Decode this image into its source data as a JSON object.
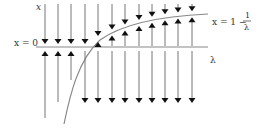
{
  "diagram": {
    "type": "bifurcation-flow-diagram",
    "labels": {
      "x_axis_label": "x",
      "origin_line_label": "x = 0",
      "curve_label_prefix": "x = 1 −",
      "curve_label_numerator": "1",
      "curve_label_denominator": "λ",
      "lambda_axis_label": "λ"
    },
    "colors": {
      "line": "#777777",
      "arrowhead": "#111111",
      "axis": "#888888",
      "curve": "#888888",
      "text": "#333333"
    },
    "axis": {
      "y": 47,
      "x_start": 36,
      "x_end": 208
    },
    "columns": [
      {
        "x": 45,
        "top": "down",
        "region": "above-both",
        "bottom_dir": "up",
        "bottom_end": 118
      },
      {
        "x": 58,
        "top": "down",
        "region": "above-both",
        "bottom_dir": "up",
        "bottom_end": 102
      },
      {
        "x": 71,
        "top": "down",
        "region": "above-both",
        "bottom_dir": "up",
        "bottom_end": 80
      },
      {
        "x": 85,
        "top": "down",
        "region": "above-both",
        "bottom_dir": "down",
        "bottom_end": 103
      },
      {
        "x": 98,
        "top": "down",
        "region": "between",
        "bottom_dir": "down",
        "bottom_end": 103
      },
      {
        "x": 112,
        "top": "down",
        "region": "between",
        "bottom_dir": "down",
        "bottom_end": 103
      },
      {
        "x": 125,
        "top": "down",
        "region": "between",
        "bottom_dir": "down",
        "bottom_end": 103
      },
      {
        "x": 139,
        "top": "down",
        "region": "between",
        "bottom_dir": "down",
        "bottom_end": 103
      },
      {
        "x": 152,
        "top": "down",
        "region": "between",
        "bottom_dir": "down",
        "bottom_end": 103
      },
      {
        "x": 165,
        "top": "down",
        "region": "between",
        "bottom_dir": "down",
        "bottom_end": 103
      },
      {
        "x": 178,
        "top": "down",
        "region": "between",
        "bottom_dir": "down",
        "bottom_end": 103
      },
      {
        "x": 192,
        "top": "down",
        "region": "between",
        "bottom_dir": "down",
        "bottom_end": 103
      }
    ]
  }
}
